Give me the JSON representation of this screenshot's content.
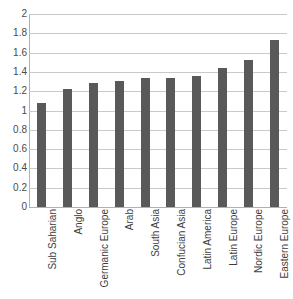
{
  "chart_data": {
    "type": "bar",
    "title": "",
    "subtitle": "",
    "xlabel": "",
    "ylabel": "",
    "categories": [
      "Sub Saharian",
      "Anglo",
      "Germanic Europe",
      "Arab",
      "South Asia",
      "Confucian Asia",
      "Latin America",
      "Latin Europe",
      "Nordic Europe",
      "Eastern Europe"
    ],
    "values": [
      1.08,
      1.22,
      1.29,
      1.31,
      1.34,
      1.34,
      1.36,
      1.44,
      1.52,
      1.73
    ],
    "ylim": [
      0,
      2
    ],
    "ytick_labels": [
      "2",
      "1.8",
      "1.6",
      "1.4",
      "1.2",
      "1",
      "0.8",
      "0.6",
      "0.4",
      "0.2",
      "0"
    ],
    "ytick_values": [
      2,
      1.8,
      1.6,
      1.4,
      1.2,
      1,
      0.8,
      0.6,
      0.4,
      0.2,
      0
    ],
    "ytick_interval": 0.2,
    "grid": true,
    "legend": "none",
    "bar_color": "#595959",
    "gridline_color": "#c9c9c9",
    "axis_color": "#b0b0b0",
    "background_color": "#ffffff"
  },
  "artifacts": {
    "top_clip_text": ""
  }
}
